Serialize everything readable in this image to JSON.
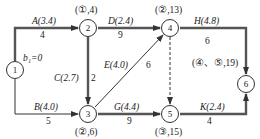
{
  "diagram": {
    "type": "activity-on-arrow network",
    "nodes": [
      {
        "id": "1",
        "label": "1",
        "annotation": "b₁=0"
      },
      {
        "id": "2",
        "label": "2",
        "annotation": "(①,4)"
      },
      {
        "id": "3",
        "label": "3",
        "annotation": "(②,6)"
      },
      {
        "id": "4",
        "label": "4",
        "annotation": "(②,13)"
      },
      {
        "id": "5",
        "label": "5",
        "annotation": "(③,15)"
      },
      {
        "id": "6",
        "label": "6",
        "annotation": "(④、⑤,19)"
      }
    ],
    "activities": [
      {
        "name": "A",
        "from": "1",
        "to": "2",
        "label": "A(3.4)",
        "duration": "4"
      },
      {
        "name": "B",
        "from": "1",
        "to": "3",
        "label": "B(4.0)",
        "duration": "5"
      },
      {
        "name": "C",
        "from": "2",
        "to": "3",
        "label": "C(2.7)",
        "duration": "2"
      },
      {
        "name": "D",
        "from": "2",
        "to": "4",
        "label": "D(2.4)",
        "duration": "9"
      },
      {
        "name": "E",
        "from": "3",
        "to": "4",
        "label": "E(4.0)",
        "duration": "6"
      },
      {
        "name": "G",
        "from": "3",
        "to": "5",
        "label": "G(4.4)",
        "duration": "9"
      },
      {
        "name": "H",
        "from": "4",
        "to": "6",
        "label": "H(4.8)",
        "duration": "6"
      },
      {
        "name": "K",
        "from": "5",
        "to": "6",
        "label": "K(2.4)",
        "duration": "4"
      },
      {
        "name": "dummy",
        "from": "4",
        "to": "5",
        "label": "",
        "duration": "",
        "dashed": true
      }
    ],
    "colors": {
      "line": "#444444",
      "text": "#222222"
    }
  }
}
